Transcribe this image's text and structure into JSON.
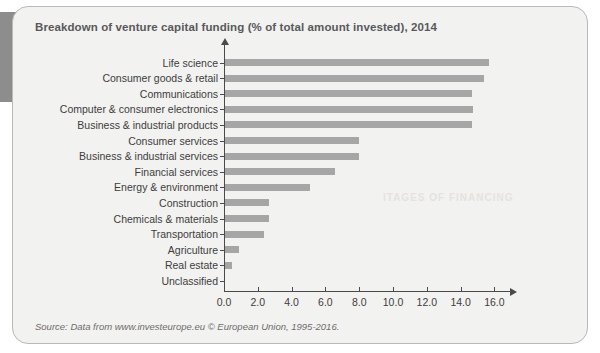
{
  "panel": {
    "title": "Breakdown of venture capital funding (% of total amount invested), 2014",
    "source": "Source: Data from www.investeurope.eu © European Union, 1995-2016."
  },
  "ghost_text": {
    "line1": "ITAGES OF FINANCING"
  },
  "chart_data": {
    "type": "bar",
    "orientation": "horizontal",
    "title": "Breakdown of venture capital funding (% of total amount invested), 2014",
    "xlabel": "",
    "ylabel": "",
    "xlim": [
      0.0,
      16.0
    ],
    "xticks": [
      "0.0",
      "2.0",
      "4.0",
      "6.0",
      "8.0",
      "10.0",
      "12.0",
      "14.0",
      "16.0"
    ],
    "xtick_values": [
      0,
      2,
      4,
      6,
      8,
      10,
      12,
      14,
      16
    ],
    "grid": false,
    "legend": false,
    "bar_color": "#a6a6a6",
    "categories": [
      "Life science",
      "Consumer goods & retail",
      "Communications",
      "Computer & consumer electronics",
      "Business & industrial products",
      "Consumer services",
      "Business & industrial services",
      "Financial services",
      "Energy & environment",
      "Construction",
      "Chemicals & materials",
      "Transportation",
      "Agriculture",
      "Real estate",
      "Unclassified"
    ],
    "values": [
      15.6,
      15.3,
      14.6,
      14.7,
      14.6,
      7.9,
      7.9,
      6.5,
      5.0,
      2.6,
      2.6,
      2.3,
      0.8,
      0.4,
      0.0
    ]
  }
}
